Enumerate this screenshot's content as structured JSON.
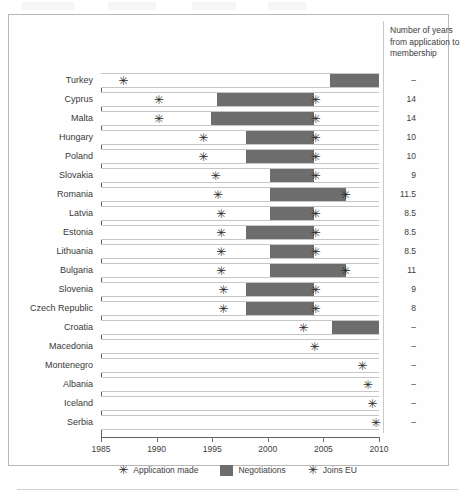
{
  "header": {
    "note": "Number of years from application to membership"
  },
  "legend": {
    "items": [
      {
        "icon": "asterisk-icon",
        "glyph": "✳",
        "label": "Application made",
        "type": "marker"
      },
      {
        "icon": "swatch-icon",
        "glyph": "",
        "label": "Negotiations",
        "type": "swatch",
        "color": "#6d6d6d"
      },
      {
        "icon": "asterisk-icon",
        "glyph": "✳",
        "label": "Joins EU",
        "type": "marker"
      }
    ]
  },
  "axis": {
    "ticks": [
      "1985",
      "1990",
      "1995",
      "2000",
      "2005",
      "2010"
    ],
    "min": 1985,
    "max": 2010
  },
  "chart_data": {
    "type": "bar",
    "subtype": "timeline-gantt",
    "title": "",
    "xlabel": "",
    "ylabel": "",
    "xlim": [
      1985,
      2010
    ],
    "grid": false,
    "legend_position": "bottom",
    "colors": {
      "negotiations": "#6d6d6d",
      "track": "#ffffff",
      "marker": "#2b2b2b"
    },
    "categories": [
      "Turkey",
      "Cyprus",
      "Malta",
      "Hungary",
      "Poland",
      "Slovakia",
      "Romania",
      "Latvia",
      "Estonia",
      "Lithuania",
      "Bulgaria",
      "Slovenia",
      "Czech Republic",
      "Croatia",
      "Macedonia",
      "Montenegro",
      "Albania",
      "Iceland",
      "Serbia"
    ],
    "rows": [
      {
        "country": "Turkey",
        "application": 1987.0,
        "negotiation_start": 2005.6,
        "negotiation_end": 2010.0,
        "joined": null,
        "years": "–"
      },
      {
        "country": "Cyprus",
        "application": 1990.2,
        "negotiation_start": 1995.4,
        "negotiation_end": 2004.2,
        "joined": 2004.3,
        "years": "14"
      },
      {
        "country": "Malta",
        "application": 1990.2,
        "negotiation_start": 1994.9,
        "negotiation_end": 2004.2,
        "joined": 2004.3,
        "years": "14"
      },
      {
        "country": "Hungary",
        "application": 1994.2,
        "negotiation_start": 1998.0,
        "negotiation_end": 2004.2,
        "joined": 2004.3,
        "years": "10"
      },
      {
        "country": "Poland",
        "application": 1994.2,
        "negotiation_start": 1998.0,
        "negotiation_end": 2004.2,
        "joined": 2004.3,
        "years": "10"
      },
      {
        "country": "Slovakia",
        "application": 1995.3,
        "negotiation_start": 2000.2,
        "negotiation_end": 2004.2,
        "joined": 2004.3,
        "years": "9"
      },
      {
        "country": "Romania",
        "application": 1995.5,
        "negotiation_start": 2000.2,
        "negotiation_end": 2007.0,
        "joined": 2007.0,
        "years": "11.5"
      },
      {
        "country": "Latvia",
        "application": 1995.8,
        "negotiation_start": 2000.2,
        "negotiation_end": 2004.2,
        "joined": 2004.3,
        "years": "8.5"
      },
      {
        "country": "Estonia",
        "application": 1995.8,
        "negotiation_start": 1998.0,
        "negotiation_end": 2004.2,
        "joined": 2004.3,
        "years": "8.5"
      },
      {
        "country": "Lithuania",
        "application": 1995.8,
        "negotiation_start": 2000.2,
        "negotiation_end": 2004.2,
        "joined": 2004.3,
        "years": "8.5"
      },
      {
        "country": "Bulgaria",
        "application": 1995.8,
        "negotiation_start": 2000.2,
        "negotiation_end": 2007.0,
        "joined": 2007.0,
        "years": "11"
      },
      {
        "country": "Slovenia",
        "application": 1996.0,
        "negotiation_start": 1998.0,
        "negotiation_end": 2004.2,
        "joined": 2004.3,
        "years": "9"
      },
      {
        "country": "Czech Republic",
        "application": 1996.0,
        "negotiation_start": 1998.0,
        "negotiation_end": 2004.2,
        "joined": 2004.3,
        "years": "8"
      },
      {
        "country": "Croatia",
        "application": 2003.2,
        "negotiation_start": 2005.8,
        "negotiation_end": 2010.0,
        "joined": null,
        "years": "–"
      },
      {
        "country": "Macedonia",
        "application": 2004.2,
        "negotiation_start": null,
        "negotiation_end": null,
        "joined": null,
        "years": "–"
      },
      {
        "country": "Montenegro",
        "application": 2008.5,
        "negotiation_start": null,
        "negotiation_end": null,
        "joined": null,
        "years": "–"
      },
      {
        "country": "Albania",
        "application": 2009.0,
        "negotiation_start": null,
        "negotiation_end": null,
        "joined": null,
        "years": "–"
      },
      {
        "country": "Iceland",
        "application": 2009.4,
        "negotiation_start": null,
        "negotiation_end": null,
        "joined": null,
        "years": "–"
      },
      {
        "country": "Serbia",
        "application": 2009.7,
        "negotiation_start": null,
        "negotiation_end": null,
        "joined": null,
        "years": "–"
      }
    ]
  }
}
